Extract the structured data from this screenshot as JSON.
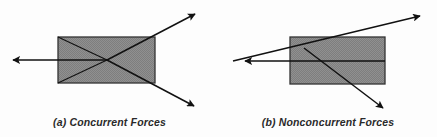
{
  "figure": {
    "background_color": "#fdfdfd",
    "body_fill_color": "#8a8a8a",
    "body_edge_color": "#333333",
    "line_color": "#111111"
  },
  "panels": [
    {
      "id": "a",
      "caption": "(a) Concurrent Forces",
      "body": {
        "shape": "rectangle",
        "x": 58,
        "y": 37,
        "width": 97,
        "height": 46
      },
      "concurrency_point": {
        "x": 107,
        "y": 60
      },
      "forces": [
        {
          "name": "force-left",
          "tip_x": 10,
          "tip_y": 60,
          "tail_x": 107,
          "tail_y": 60
        },
        {
          "name": "force-upper-right",
          "tip_x": 197,
          "tip_y": 13,
          "tail_x": 107,
          "tail_y": 60
        },
        {
          "name": "force-lower-right",
          "tip_x": 196,
          "tip_y": 107,
          "tail_x": 107,
          "tail_y": 60
        },
        {
          "name": "construction-line-upper-left",
          "tip_x": 58,
          "tip_y": 37,
          "tail_x": 107,
          "tail_y": 60
        },
        {
          "name": "construction-line-lower-left",
          "tip_x": 58,
          "tip_y": 83,
          "tail_x": 107,
          "tail_y": 60
        }
      ]
    },
    {
      "id": "b",
      "caption": "(b) Nonconcurrent Forces",
      "body": {
        "shape": "rectangle",
        "x": 71,
        "y": 37,
        "width": 95,
        "height": 47
      },
      "concurrency_point": null,
      "forces": [
        {
          "name": "force-left",
          "tip_x": 23,
          "tip_y": 61,
          "tail_x": 71,
          "tail_y": 61
        },
        {
          "name": "force-upper-right",
          "tip_x": 203,
          "tip_y": 15,
          "tail_x": 14,
          "tail_y": 61
        },
        {
          "name": "force-lower-right",
          "tip_x": 166,
          "tip_y": 110,
          "tail_x": 85,
          "tail_y": 48
        }
      ]
    }
  ]
}
